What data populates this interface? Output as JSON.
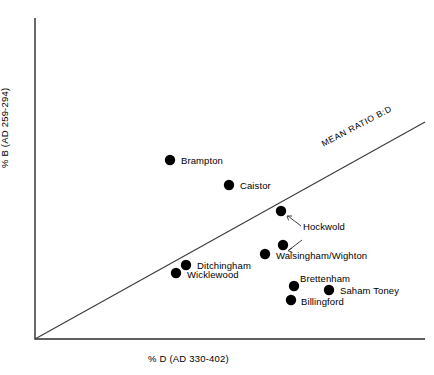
{
  "chart_data": {
    "type": "scatter",
    "title": "",
    "xlabel": "% D (AD 330-402)",
    "ylabel": "% B (AD 259-294)",
    "grid": false,
    "legend": null,
    "axis_ticks": false,
    "annotations": [
      {
        "name": "mean-ratio-line",
        "text": "MEAN RATIO B:D",
        "type": "reference-line",
        "description": "diagonal line from origin rising to the upper right"
      }
    ],
    "points": [
      {
        "label": "Brampton",
        "x": 170,
        "y": 160,
        "label_x": 181,
        "label_y": 156,
        "leader": false
      },
      {
        "label": "Caistor",
        "x": 229,
        "y": 185,
        "label_x": 240,
        "label_y": 181,
        "leader": false
      },
      {
        "label": "Hockwold",
        "x": 281,
        "y": 211,
        "label_x": 303,
        "label_y": 222,
        "leader": true
      },
      {
        "label": "",
        "x": 283,
        "y": 245,
        "label_x": 0,
        "label_y": 0,
        "leader": true
      },
      {
        "label": "Walsingham/Wighton",
        "x": 265,
        "y": 254,
        "label_x": 276,
        "label_y": 251,
        "leader": false
      },
      {
        "label": "Ditchingham",
        "x": 186,
        "y": 265,
        "label_x": 197,
        "label_y": 261,
        "leader": false
      },
      {
        "label": "Wicklewood",
        "x": 176,
        "y": 273,
        "label_x": 187,
        "label_y": 270,
        "leader": false
      },
      {
        "label": "Brettenham",
        "x": 294,
        "y": 286,
        "label_x": 300,
        "label_y": 274,
        "leader": false
      },
      {
        "label": "Saham Toney",
        "x": 329,
        "y": 290,
        "label_x": 340,
        "label_y": 286,
        "leader": false
      },
      {
        "label": "Billingford",
        "x": 291,
        "y": 300,
        "label_x": 301,
        "label_y": 297,
        "leader": false
      }
    ]
  }
}
